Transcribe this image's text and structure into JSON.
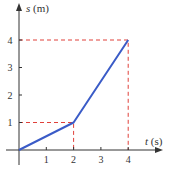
{
  "chart_data": {
    "type": "line",
    "title": "",
    "xlabel": "t (s)",
    "ylabel": "s (m)",
    "xlabel_var": "t",
    "xlabel_unit": "(s)",
    "ylabel_var": "s",
    "ylabel_unit": "(m)",
    "x_ticks": [
      "1",
      "2",
      "3",
      "4"
    ],
    "y_ticks": [
      "1",
      "2",
      "3",
      "4"
    ],
    "xlim": [
      0,
      5
    ],
    "ylim": [
      0,
      5
    ],
    "grid": false,
    "legend": null,
    "series": [
      {
        "name": "s(t)",
        "color": "#3a5bc7",
        "x": [
          0,
          2,
          4
        ],
        "y": [
          0,
          1,
          4
        ]
      }
    ],
    "guides": [
      {
        "type": "dashed",
        "color": "#e0403a",
        "from": [
          0,
          1
        ],
        "corner": [
          2,
          1
        ],
        "to": [
          2,
          0
        ]
      },
      {
        "type": "dashed",
        "color": "#e0403a",
        "from": [
          0,
          4
        ],
        "corner": [
          4,
          4
        ],
        "to": [
          4,
          0
        ]
      }
    ]
  }
}
